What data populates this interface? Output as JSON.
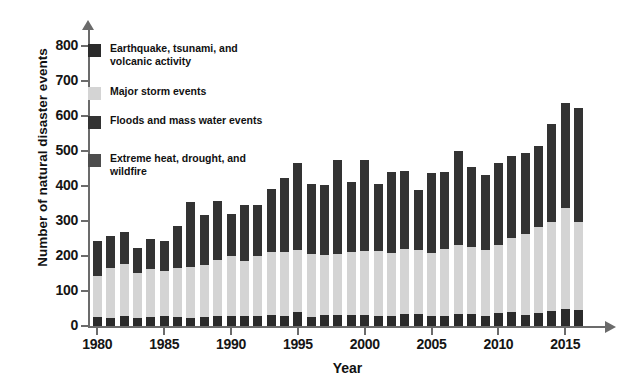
{
  "chart_data": {
    "type": "bar",
    "subtype": "stacked-bar",
    "title": "",
    "xlabel": "Year",
    "ylabel": "Number of natural disaster events",
    "xlim": [
      1979.3,
      2017.6
    ],
    "ylim": [
      0,
      800
    ],
    "yticks": [
      0,
      100,
      200,
      300,
      400,
      500,
      600,
      700,
      800
    ],
    "xticks": [
      1980,
      1985,
      1990,
      1995,
      2000,
      2005,
      2010,
      2015
    ],
    "grid": false,
    "legend_position": "upper left",
    "categories": [
      1980,
      1981,
      1982,
      1983,
      1984,
      1985,
      1986,
      1987,
      1988,
      1989,
      1990,
      1991,
      1992,
      1993,
      1994,
      1995,
      1996,
      1997,
      1998,
      1999,
      2000,
      2001,
      2002,
      2003,
      2004,
      2005,
      2006,
      2007,
      2008,
      2009,
      2010,
      2011,
      2012,
      2013,
      2014,
      2015,
      2016
    ],
    "series": [
      {
        "name": "Earthquake, tsunami, and volcanic activity",
        "color": "#2b2b2b",
        "values": [
          26,
          24,
          30,
          22,
          25,
          30,
          26,
          22,
          25,
          30,
          30,
          28,
          30,
          32,
          30,
          40,
          27,
          32,
          31,
          32,
          32,
          30,
          30,
          33,
          33,
          28,
          30,
          33,
          33,
          30,
          36,
          40,
          32,
          36,
          44,
          48,
          46
        ]
      },
      {
        "name": "Major storm events",
        "color": "#d4d4d4",
        "values": [
          118,
          142,
          147,
          130,
          138,
          128,
          140,
          148,
          150,
          160,
          170,
          158,
          170,
          180,
          182,
          178,
          180,
          172,
          176,
          180,
          182,
          185,
          180,
          186,
          185,
          180,
          190,
          198,
          192,
          188,
          195,
          212,
          230,
          248,
          252,
          288,
          252
        ]
      },
      {
        "name": "Floods and mass water events",
        "color": "#333333",
        "values": [
          98,
          92,
          93,
          70,
          86,
          86,
          120,
          185,
          143,
          168,
          120,
          160,
          145,
          180,
          212,
          248,
          200,
          200,
          268,
          200,
          260,
          192,
          230,
          224,
          170,
          228,
          220,
          270,
          228,
          213,
          235,
          235,
          232,
          230,
          280,
          300,
          325
        ]
      },
      {
        "name": "Extreme heat, drought, and wildfire",
        "color": "#4d4d4d",
        "values": [
          0,
          0,
          0,
          0,
          0,
          0,
          0,
          0,
          0,
          0,
          0,
          0,
          0,
          0,
          0,
          0,
          0,
          0,
          0,
          0,
          0,
          0,
          0,
          0,
          0,
          0,
          0,
          0,
          0,
          0,
          0,
          0,
          0,
          0,
          0,
          0,
          0
        ]
      }
    ],
    "totals": [
      242,
      258,
      270,
      222,
      249,
      244,
      286,
      355,
      318,
      358,
      320,
      346,
      345,
      392,
      424,
      466,
      407,
      404,
      475,
      412,
      474,
      407,
      440,
      443,
      388,
      436,
      440,
      501,
      453,
      431,
      466,
      487,
      494,
      514,
      576,
      636,
      623
    ]
  },
  "legend": {
    "items": [
      {
        "label": "Earthquake, tsunami, and volcanic activity",
        "color": "#2b2b2b"
      },
      {
        "label": "Major storm events",
        "color": "#d4d4d4"
      },
      {
        "label": "Floods and mass water events",
        "color": "#333333"
      },
      {
        "label": "Extreme heat, drought, and wildfire",
        "color": "#4d4d4d"
      }
    ]
  },
  "axis": {
    "y_title": "Number of natural disaster events",
    "x_title": "Year",
    "y_tick_labels": [
      "0",
      "100",
      "200",
      "300",
      "400",
      "500",
      "600",
      "700",
      "800"
    ],
    "x_tick_labels": [
      "1980",
      "1985",
      "1990",
      "1995",
      "2000",
      "2005",
      "2010",
      "2015"
    ]
  }
}
